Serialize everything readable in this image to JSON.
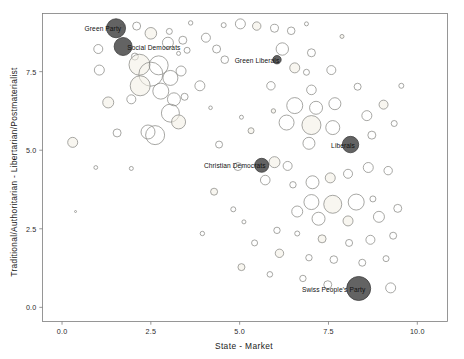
{
  "chart_data": {
    "type": "scatter",
    "title": "",
    "xlabel": "State  -  Market",
    "ylabel": "Traditional/Authoritarian  -  Libertarian/Postmaterialist",
    "xlim": [
      -0.55,
      10.85
    ],
    "ylim": [
      -0.45,
      9.35
    ],
    "xticks": [
      "0.0",
      "2.5",
      "5.0",
      "7.5",
      "10.0"
    ],
    "xtick_values": [
      0.0,
      2.5,
      5.0,
      7.5,
      10.0
    ],
    "yticks": [
      "0.0",
      "2.5",
      "5.0",
      "7.5"
    ],
    "ytick_values": [
      0.0,
      2.5,
      5.0,
      7.5
    ],
    "grid": false,
    "legend": "none",
    "marker_style": "bubble",
    "size_encodes": "party size",
    "highlight_color": "#565656",
    "bubble_stroke": "#8a8a86",
    "bubble_fill_light": "#f2efe4",
    "annotations": [
      {
        "label": "Green Party",
        "x": 1.52,
        "y": 8.88,
        "r": 9.5,
        "highlighted": true,
        "label_side": "left"
      },
      {
        "label": "Social Democrats",
        "x": 1.72,
        "y": 8.3,
        "r": 9.0,
        "highlighted": true,
        "label_side": "right"
      },
      {
        "label": "Green Liberals",
        "x": 6.05,
        "y": 7.88,
        "r": 4.2,
        "highlighted": true,
        "label_side": "left"
      },
      {
        "label": "Liberals",
        "x": 8.12,
        "y": 5.18,
        "r": 8.2,
        "highlighted": true,
        "label_side": "left"
      },
      {
        "label": "Christian Democrats",
        "x": 5.62,
        "y": 4.52,
        "r": 7.0,
        "highlighted": true,
        "label_side": "left"
      },
      {
        "label": "Swiss People's Party",
        "x": 8.35,
        "y": 0.6,
        "r": 12.0,
        "highlighted": true,
        "label_side": "left"
      }
    ],
    "points": [
      {
        "x": 0.3,
        "y": 5.25,
        "r": 5.0
      },
      {
        "x": 0.95,
        "y": 4.45,
        "r": 1.9
      },
      {
        "x": 0.38,
        "y": 3.05,
        "r": 1.0
      },
      {
        "x": 1.55,
        "y": 5.55,
        "r": 4.0
      },
      {
        "x": 2.42,
        "y": 5.58,
        "r": 7.0
      },
      {
        "x": 1.3,
        "y": 6.52,
        "r": 5.5
      },
      {
        "x": 1.95,
        "y": 6.62,
        "r": 4.5
      },
      {
        "x": 1.05,
        "y": 7.55,
        "r": 5.0
      },
      {
        "x": 1.02,
        "y": 8.22,
        "r": 4.5
      },
      {
        "x": 2.1,
        "y": 8.95,
        "r": 4.0
      },
      {
        "x": 2.5,
        "y": 8.72,
        "r": 5.8
      },
      {
        "x": 3.02,
        "y": 8.78,
        "r": 3.0
      },
      {
        "x": 2.98,
        "y": 8.42,
        "r": 5.5
      },
      {
        "x": 3.4,
        "y": 8.5,
        "r": 4.0
      },
      {
        "x": 2.05,
        "y": 7.98,
        "r": 3.5
      },
      {
        "x": 2.18,
        "y": 7.72,
        "r": 10.5
      },
      {
        "x": 2.72,
        "y": 7.7,
        "r": 9.5
      },
      {
        "x": 2.5,
        "y": 7.42,
        "r": 12.0
      },
      {
        "x": 3.05,
        "y": 7.3,
        "r": 7.5
      },
      {
        "x": 3.35,
        "y": 7.52,
        "r": 5.0
      },
      {
        "x": 2.2,
        "y": 7.05,
        "r": 10.0
      },
      {
        "x": 2.78,
        "y": 6.88,
        "r": 8.0
      },
      {
        "x": 3.15,
        "y": 6.62,
        "r": 6.5
      },
      {
        "x": 3.45,
        "y": 6.7,
        "r": 3.5
      },
      {
        "x": 3.05,
        "y": 6.18,
        "r": 9.0
      },
      {
        "x": 3.28,
        "y": 5.9,
        "r": 7.0
      },
      {
        "x": 2.62,
        "y": 5.48,
        "r": 9.5
      },
      {
        "x": 3.52,
        "y": 8.18,
        "r": 3.0
      },
      {
        "x": 4.05,
        "y": 8.58,
        "r": 4.5
      },
      {
        "x": 4.35,
        "y": 8.22,
        "r": 4.0
      },
      {
        "x": 1.68,
        "y": 8.95,
        "r": 2.0
      },
      {
        "x": 3.28,
        "y": 8.08,
        "r": 2.0
      },
      {
        "x": 4.58,
        "y": 7.88,
        "r": 3.8
      },
      {
        "x": 3.88,
        "y": 7.05,
        "r": 5.0
      },
      {
        "x": 5.02,
        "y": 9.02,
        "r": 5.0
      },
      {
        "x": 5.48,
        "y": 8.95,
        "r": 4.2
      },
      {
        "x": 5.98,
        "y": 8.88,
        "r": 4.0
      },
      {
        "x": 6.45,
        "y": 8.8,
        "r": 3.8
      },
      {
        "x": 6.2,
        "y": 8.22,
        "r": 6.2
      },
      {
        "x": 7.02,
        "y": 8.1,
        "r": 4.0
      },
      {
        "x": 6.55,
        "y": 7.62,
        "r": 5.0
      },
      {
        "x": 6.88,
        "y": 7.48,
        "r": 3.0
      },
      {
        "x": 7.58,
        "y": 7.55,
        "r": 4.5
      },
      {
        "x": 5.88,
        "y": 7.05,
        "r": 4.2
      },
      {
        "x": 7.02,
        "y": 6.92,
        "r": 4.8
      },
      {
        "x": 5.95,
        "y": 6.25,
        "r": 2.2
      },
      {
        "x": 6.55,
        "y": 6.42,
        "r": 8.0
      },
      {
        "x": 7.15,
        "y": 6.35,
        "r": 6.5
      },
      {
        "x": 7.68,
        "y": 6.48,
        "r": 6.0
      },
      {
        "x": 6.32,
        "y": 5.88,
        "r": 7.5
      },
      {
        "x": 7.02,
        "y": 5.8,
        "r": 9.5
      },
      {
        "x": 7.62,
        "y": 5.72,
        "r": 7.0
      },
      {
        "x": 6.95,
        "y": 5.22,
        "r": 6.0
      },
      {
        "x": 8.58,
        "y": 6.1,
        "r": 5.0
      },
      {
        "x": 8.72,
        "y": 5.48,
        "r": 4.0
      },
      {
        "x": 9.05,
        "y": 6.45,
        "r": 4.5
      },
      {
        "x": 8.32,
        "y": 7.02,
        "r": 3.5
      },
      {
        "x": 9.35,
        "y": 5.85,
        "r": 3.0
      },
      {
        "x": 4.42,
        "y": 5.18,
        "r": 3.5
      },
      {
        "x": 4.95,
        "y": 4.48,
        "r": 4.0
      },
      {
        "x": 5.98,
        "y": 4.62,
        "r": 5.5
      },
      {
        "x": 6.35,
        "y": 4.5,
        "r": 4.5
      },
      {
        "x": 5.72,
        "y": 4.05,
        "r": 4.8
      },
      {
        "x": 6.5,
        "y": 3.9,
        "r": 3.2
      },
      {
        "x": 7.05,
        "y": 3.98,
        "r": 6.5
      },
      {
        "x": 7.55,
        "y": 4.12,
        "r": 5.0
      },
      {
        "x": 8.05,
        "y": 4.25,
        "r": 4.5
      },
      {
        "x": 8.62,
        "y": 4.45,
        "r": 5.0
      },
      {
        "x": 9.18,
        "y": 4.35,
        "r": 4.2
      },
      {
        "x": 7.02,
        "y": 3.35,
        "r": 7.5
      },
      {
        "x": 7.62,
        "y": 3.28,
        "r": 9.0
      },
      {
        "x": 8.28,
        "y": 3.35,
        "r": 8.0
      },
      {
        "x": 8.75,
        "y": 3.45,
        "r": 3.0
      },
      {
        "x": 6.62,
        "y": 3.05,
        "r": 5.5
      },
      {
        "x": 7.22,
        "y": 2.82,
        "r": 6.5
      },
      {
        "x": 8.05,
        "y": 2.75,
        "r": 5.0
      },
      {
        "x": 8.92,
        "y": 2.88,
        "r": 5.5
      },
      {
        "x": 9.45,
        "y": 3.15,
        "r": 4.0
      },
      {
        "x": 6.05,
        "y": 2.45,
        "r": 3.2
      },
      {
        "x": 6.62,
        "y": 2.35,
        "r": 2.5
      },
      {
        "x": 7.32,
        "y": 2.18,
        "r": 4.0
      },
      {
        "x": 8.08,
        "y": 2.05,
        "r": 3.5
      },
      {
        "x": 8.68,
        "y": 2.15,
        "r": 4.5
      },
      {
        "x": 9.32,
        "y": 2.28,
        "r": 3.5
      },
      {
        "x": 5.42,
        "y": 2.05,
        "r": 3.0
      },
      {
        "x": 6.12,
        "y": 1.72,
        "r": 4.2
      },
      {
        "x": 6.95,
        "y": 1.58,
        "r": 3.2
      },
      {
        "x": 7.65,
        "y": 1.52,
        "r": 3.8
      },
      {
        "x": 8.45,
        "y": 1.42,
        "r": 3.5
      },
      {
        "x": 9.12,
        "y": 1.55,
        "r": 3.0
      },
      {
        "x": 5.05,
        "y": 1.28,
        "r": 3.5
      },
      {
        "x": 5.85,
        "y": 1.05,
        "r": 2.8
      },
      {
        "x": 6.78,
        "y": 0.92,
        "r": 3.2
      },
      {
        "x": 7.48,
        "y": 0.72,
        "r": 4.0
      },
      {
        "x": 9.25,
        "y": 0.62,
        "r": 5.0
      },
      {
        "x": 4.28,
        "y": 3.68,
        "r": 3.5
      },
      {
        "x": 4.82,
        "y": 3.12,
        "r": 2.5
      },
      {
        "x": 5.12,
        "y": 2.72,
        "r": 2.0
      },
      {
        "x": 3.95,
        "y": 2.35,
        "r": 2.2
      },
      {
        "x": 4.55,
        "y": 8.98,
        "r": 2.5
      },
      {
        "x": 5.32,
        "y": 5.62,
        "r": 3.0
      },
      {
        "x": 5.05,
        "y": 6.05,
        "r": 2.0
      },
      {
        "x": 4.18,
        "y": 6.35,
        "r": 1.8
      },
      {
        "x": 1.95,
        "y": 4.42,
        "r": 2.0
      },
      {
        "x": 3.62,
        "y": 9.05,
        "r": 2.2
      },
      {
        "x": 7.88,
        "y": 8.62,
        "r": 2.0
      },
      {
        "x": 9.55,
        "y": 7.05,
        "r": 2.5
      },
      {
        "x": 6.88,
        "y": 9.02,
        "r": 2.0
      }
    ]
  },
  "axes": {
    "frame_color": "#7d7d7d",
    "background": "#ffffff"
  }
}
